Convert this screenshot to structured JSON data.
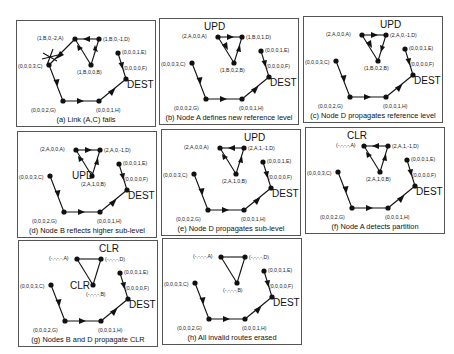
{
  "figure": {
    "dest_label": "DEST",
    "panels": [
      {
        "id": "a",
        "caption": "(a) Link (A,C) fails",
        "marker": "",
        "nodes": {
          "A": "(1,B,0,-2,A)",
          "B": "(1,B,0,0,B)",
          "C": "(0,0,0,3,C)",
          "D": "(1,B,0,-1,D)",
          "E": "(0,0,0,1,E)",
          "F": "(0,0,0,0,F)",
          "G": "(0,0,0,2,G)",
          "H": "(0,0,0,1,H)"
        },
        "link_failure": "A-C"
      },
      {
        "id": "b",
        "caption": "(b) Node A defines new reference level",
        "marker": "UPD",
        "nodes": {
          "A": "(2,A,0,0,A)",
          "B": "(1,B,0,2,B)",
          "C": "(0,0,0,3,C)",
          "D": "(1,B,0,1,D)",
          "E": "(0,0,0,1,E)",
          "F": "(0,0,0,0,F)",
          "G": "(0,0,0,2,G)",
          "H": "(0,0,0,1,H)"
        }
      },
      {
        "id": "c",
        "caption": "(c) Node D propagates reference level",
        "marker": "UPD",
        "nodes": {
          "A": "(2,A,0,0,A)",
          "B": "(1,B,0,2,B)",
          "C": "(0,0,0,3,C)",
          "D": "(2,A,0,-1,D)",
          "E": "(0,0,0,1,E)",
          "F": "(0,0,0,0,F)",
          "G": "(0,0,0,2,G)",
          "H": "(0,0,0,1,H)"
        }
      },
      {
        "id": "d",
        "caption": "(d) Node B reflects higher sub-level",
        "marker": "UPD",
        "nodes": {
          "A": "(2,A,0,0,A)",
          "B": "(2,A,1,0,B)",
          "C": "(0,0,0,3,C)",
          "D": "(2,A,0,-1,D)",
          "E": "(0,0,0,1,E)",
          "F": "(0,0,0,0,F)",
          "G": "(0,0,0,2,G)",
          "H": "(0,0,0,1,H)"
        }
      },
      {
        "id": "e",
        "caption": "(e) Node D propagates sub-level",
        "marker": "UPD",
        "nodes": {
          "A": "(2,A,0,0,A)",
          "B": "(2,A,1,0,B)",
          "C": "(0,0,0,3,C)",
          "D": "(2,A,1,-1,D)",
          "E": "(0,0,0,1,E)",
          "F": "(0,0,0,0,F)",
          "G": "(0,0,0,2,G)",
          "H": "(0,0,0,1,H)"
        }
      },
      {
        "id": "f",
        "caption": "(f) Node A detects partition",
        "marker": "CLR",
        "nodes": {
          "A": "(-,-,-,-,A)",
          "B": "(2,A,1,0,B)",
          "C": "(0,0,0,3,C)",
          "D": "(2,A,1,-1,D)",
          "E": "(0,0,0,1,E)",
          "F": "(0,0,0,0,F)",
          "G": "(0,0,0,2,G)",
          "H": "(0,0,0,1,H)"
        }
      },
      {
        "id": "g",
        "caption": "(g) Nodes B and D propagate CLR",
        "marker": "CLR",
        "marker2": "CLR",
        "nodes": {
          "A": "(-,-,-,-,A)",
          "B": "(-,-,-,-,B)",
          "C": "(0,0,0,3,C)",
          "D": "(-,-,-,-,D)",
          "E": "(0,0,0,1,E)",
          "F": "(0,0,0,0,F)",
          "G": "(0,0,0,2,G)",
          "H": "(0,0,0,1,H)"
        }
      },
      {
        "id": "h",
        "caption": "(h) All invalid routes erased",
        "marker": "",
        "nodes": {
          "A": "(-,-,-,-,A)",
          "B": "(-,-,-,-,B)",
          "C": "(0,0,0,3,C)",
          "D": "(-,-,-,-,D)",
          "E": "(0,0,0,1,E)",
          "F": "(0,0,0,0,F)",
          "G": "(0,0,0,2,G)",
          "H": "(0,0,0,1,H)"
        }
      }
    ]
  }
}
